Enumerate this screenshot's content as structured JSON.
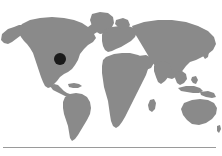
{
  "figure": {
    "kind": "world-map",
    "background_color": "#ffffff",
    "land_color": "#8a8a8a",
    "ocean_color": "#ffffff",
    "marker": {
      "label": "location-marker",
      "color": "#1a1a1a",
      "shape": "filled-circle",
      "region": "North America",
      "x_px": 60,
      "y_px": 59,
      "radius_px": 6
    },
    "divider": {
      "color": "#9a9a9a",
      "x_px": 3,
      "y_px": 147,
      "width_px": 213,
      "thickness_px": 1
    },
    "caption": ""
  },
  "chart_data": {
    "type": "scatter",
    "subtitle": "",
    "xlabel": "Longitude",
    "ylabel": "Latitude",
    "xlim": [
      -180,
      180
    ],
    "ylim": [
      -60,
      84
    ],
    "grid": false,
    "legend": "none",
    "projection": "equirectangular",
    "basemap": {
      "land_color": "#8a8a8a",
      "ocean_color": "#ffffff",
      "landmasses": [
        "North America",
        "South America",
        "Greenland",
        "Europe",
        "Africa",
        "Asia",
        "Australia",
        "Indonesia"
      ]
    },
    "series": [
      {
        "name": "location-marker",
        "marker": "filled-circle",
        "color": "#1a1a1a",
        "size_px": 12,
        "points": [
          {
            "label": "Great Lakes / US Northeast",
            "lon": -81,
            "lat": 42
          }
        ]
      }
    ],
    "annotations": []
  }
}
